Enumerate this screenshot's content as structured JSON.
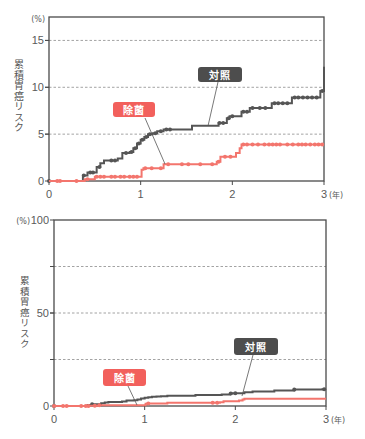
{
  "chart_data": [
    {
      "type": "line",
      "step": true,
      "title": "",
      "xlabel": "",
      "ylabel": "累積胃癌リスク",
      "y_unit": "(%)",
      "x_unit": "(年)",
      "xlim": [
        0,
        3
      ],
      "ylim": [
        0,
        17.5
      ],
      "x_ticks": [
        0,
        1,
        2,
        3
      ],
      "y_ticks": [
        0,
        5,
        10,
        15
      ],
      "gridlines_y": [
        5,
        10,
        15
      ],
      "grid": true,
      "legend": "callout labels",
      "series": [
        {
          "name": "対照",
          "color": "#555555",
          "label_color": "#4d4d4d",
          "points": [
            [
              0,
              0
            ],
            [
              0.37,
              0.6
            ],
            [
              0.42,
              0.9
            ],
            [
              0.52,
              1.5
            ],
            [
              0.56,
              1.9
            ],
            [
              0.6,
              2.2
            ],
            [
              0.75,
              2.4
            ],
            [
              0.8,
              3.0
            ],
            [
              0.88,
              3.1
            ],
            [
              0.92,
              3.5
            ],
            [
              0.96,
              4.0
            ],
            [
              1.0,
              4.4
            ],
            [
              1.04,
              4.7
            ],
            [
              1.08,
              5.0
            ],
            [
              1.13,
              5.1
            ],
            [
              1.18,
              5.3
            ],
            [
              1.25,
              5.5
            ],
            [
              1.56,
              5.9
            ],
            [
              1.85,
              6.2
            ],
            [
              1.94,
              6.7
            ],
            [
              1.97,
              6.9
            ],
            [
              2.1,
              7.4
            ],
            [
              2.19,
              7.8
            ],
            [
              2.43,
              8.3
            ],
            [
              2.65,
              8.9
            ],
            [
              2.96,
              9.6
            ],
            [
              3.0,
              12.2
            ]
          ],
          "censor_x": [
            0,
            0.38,
            0.45,
            0.48,
            0.55,
            0.68,
            0.72,
            0.84,
            0.9,
            0.94,
            0.98,
            1.02,
            1.06,
            1.1,
            1.16,
            1.22,
            1.28,
            1.32,
            1.86,
            1.9,
            1.96,
            2.0,
            2.12,
            2.16,
            2.22,
            2.3,
            2.36,
            2.46,
            2.5,
            2.55,
            2.6,
            2.68,
            2.72,
            2.77,
            2.82,
            2.87,
            2.92,
            2.98
          ]
        },
        {
          "name": "除菌",
          "color": "#f3756d",
          "label_color": "#f2605c",
          "points": [
            [
              0,
              0
            ],
            [
              0.39,
              0.2
            ],
            [
              0.5,
              0.45
            ],
            [
              1.01,
              1.2
            ],
            [
              1.03,
              1.35
            ],
            [
              1.25,
              1.8
            ],
            [
              1.83,
              2.05
            ],
            [
              1.87,
              2.6
            ],
            [
              2.04,
              3.0
            ],
            [
              2.08,
              3.5
            ],
            [
              2.1,
              3.9
            ]
          ],
          "censor_x": [
            0.09,
            0.12,
            0.3,
            0.42,
            0.52,
            0.56,
            0.6,
            0.68,
            0.72,
            0.78,
            0.82,
            0.88,
            0.92,
            0.96,
            1.05,
            1.12,
            1.22,
            1.3,
            1.45,
            1.52,
            1.65,
            1.78,
            1.85,
            1.92,
            1.98,
            2.12,
            2.16,
            2.22,
            2.28,
            2.35,
            2.4,
            2.44,
            2.48,
            2.52,
            2.6,
            2.66,
            2.72,
            2.76,
            2.8,
            2.85,
            2.9,
            2.94,
            2.98
          ]
        }
      ]
    },
    {
      "type": "line",
      "step": true,
      "title": "",
      "xlabel": "",
      "ylabel": "累積胃癌リスク",
      "y_unit": "(%)",
      "x_unit": "(年)",
      "xlim": [
        0,
        3
      ],
      "ylim": [
        0,
        100
      ],
      "x_ticks": [
        0,
        1,
        2,
        3
      ],
      "y_ticks": [
        0,
        50,
        100
      ],
      "gridlines_y": [
        25,
        50,
        75
      ],
      "grid": true,
      "legend": "callout labels",
      "series": [
        {
          "name": "対照",
          "color": "#555555",
          "label_color": "#4d4d4d",
          "points": [
            [
              0,
              0
            ],
            [
              0.37,
              0.6
            ],
            [
              0.42,
              0.9
            ],
            [
              0.52,
              1.5
            ],
            [
              0.56,
              1.9
            ],
            [
              0.6,
              2.2
            ],
            [
              0.75,
              2.4
            ],
            [
              0.8,
              3.0
            ],
            [
              0.88,
              3.1
            ],
            [
              0.92,
              3.5
            ],
            [
              0.96,
              4.0
            ],
            [
              1.0,
              4.4
            ],
            [
              1.04,
              4.7
            ],
            [
              1.08,
              5.0
            ],
            [
              1.13,
              5.1
            ],
            [
              1.18,
              5.3
            ],
            [
              1.25,
              5.5
            ],
            [
              1.56,
              5.9
            ],
            [
              1.85,
              6.2
            ],
            [
              1.94,
              6.7
            ],
            [
              1.97,
              6.9
            ],
            [
              2.1,
              7.4
            ],
            [
              2.19,
              7.8
            ],
            [
              2.43,
              8.3
            ],
            [
              2.65,
              8.9
            ],
            [
              2.96,
              9.0
            ]
          ],
          "censor_x": [
            0,
            0.42,
            1.95,
            2.0,
            2.65,
            2.98
          ]
        },
        {
          "name": "除菌",
          "color": "#f3756d",
          "label_color": "#f2605c",
          "points": [
            [
              0,
              0
            ],
            [
              0.39,
              0.2
            ],
            [
              0.5,
              0.45
            ],
            [
              1.01,
              1.2
            ],
            [
              1.03,
              1.35
            ],
            [
              1.25,
              1.8
            ],
            [
              1.83,
              2.05
            ],
            [
              1.87,
              2.6
            ],
            [
              2.04,
              3.0
            ],
            [
              2.08,
              3.5
            ],
            [
              2.1,
              3.9
            ]
          ],
          "censor_x": [
            0,
            0.1,
            0.14,
            0.3,
            0.35,
            0.38,
            0.45,
            0.5,
            1.04,
            1.75,
            1.8
          ]
        }
      ]
    }
  ]
}
